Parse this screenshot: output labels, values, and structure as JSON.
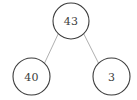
{
  "diagram": {
    "type": "binary-tree",
    "background_color": "#ffffff",
    "node_stroke_color": "#3c3c3c",
    "node_fill_color": "#ffffff",
    "node_text_color": "#3c3c3c",
    "edge_color": "#9a9a9a",
    "node_stroke_width": 1.1,
    "edge_stroke_width": 0.8,
    "nodes": [
      {
        "id": "root",
        "label": "43",
        "cx": 71,
        "cy": 21,
        "r": 18,
        "role": "root"
      },
      {
        "id": "left-child",
        "label": "40",
        "cx": 31.5,
        "cy": 76.5,
        "r": 18.5,
        "role": "left-child"
      },
      {
        "id": "right-child",
        "label": "3",
        "cx": 111.5,
        "cy": 76.5,
        "r": 18.5,
        "role": "right-child"
      }
    ],
    "edges": [
      {
        "id": "edge-root-left",
        "from": "root",
        "to": "left-child",
        "x1": 58.2,
        "y1": 33.9,
        "x2": 44.5,
        "y2": 63.2
      },
      {
        "id": "edge-root-right",
        "from": "root",
        "to": "right-child",
        "x1": 83.8,
        "y1": 33.9,
        "x2": 98.7,
        "y2": 63.5
      }
    ]
  }
}
